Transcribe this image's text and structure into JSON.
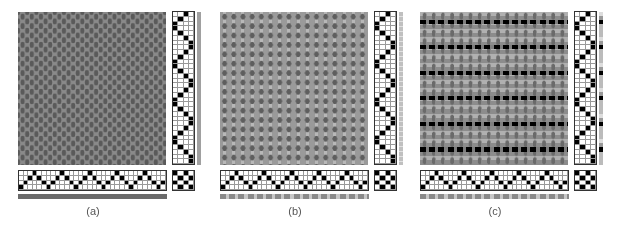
{
  "figure": {
    "panels": [
      {
        "id": "a",
        "caption": "(a)",
        "cloth_style": "uniform",
        "colors": {
          "warp": "#8a8a8a",
          "weft": "#5a5a5a",
          "float": "#6e6e6e"
        },
        "weft_bar_color": "#a0a0a0",
        "warp_bar_color": "#6a6a6a"
      },
      {
        "id": "b",
        "caption": "(b)",
        "cloth_style": "striped-warp",
        "colors": {
          "warp": "#9a9a9a",
          "weft": "#5e5e5e",
          "float": "#b8b8b8"
        },
        "weft_bar_color": "#c0c0c0",
        "warp_bar_color": "#8a8a8a"
      },
      {
        "id": "c",
        "caption": "(c)",
        "cloth_style": "banded-weft",
        "colors": {
          "warp": "#8c8c8c",
          "weft": "#6a6a6a",
          "float": "#b0b0b0",
          "accent": "#000000"
        },
        "weft_bar_color": "#9a9a9a",
        "warp_bar_color": "#8a8a8a"
      }
    ],
    "threading": {
      "shafts": 4,
      "ends": 32,
      "sequence": [
        1,
        2,
        3,
        4,
        3,
        2,
        1,
        2,
        3,
        4,
        3,
        2,
        1,
        2,
        3,
        4,
        3,
        2,
        1,
        2,
        3,
        4,
        3,
        2,
        1,
        2,
        3,
        4,
        3,
        2,
        1,
        2
      ]
    },
    "treadling": {
      "treadles": 4,
      "picks": 32,
      "sequence": [
        3,
        2,
        1,
        1,
        2,
        3,
        4,
        4,
        3,
        2,
        1,
        1,
        2,
        3,
        4,
        4,
        3,
        2,
        1,
        1,
        2,
        3,
        4,
        4,
        3,
        2,
        1,
        1,
        2,
        3,
        4,
        4
      ]
    },
    "tieup": [
      [
        1,
        0,
        1,
        0
      ],
      [
        0,
        1,
        0,
        1
      ],
      [
        1,
        0,
        1,
        0
      ],
      [
        0,
        1,
        0,
        1
      ]
    ]
  }
}
